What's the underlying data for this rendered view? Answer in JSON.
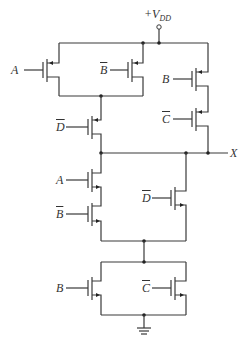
{
  "diagram": {
    "type": "CMOS logic gate schematic",
    "supply_label": "+V",
    "supply_subscript": "DD",
    "output_label": "X",
    "ground": "ground-symbol",
    "pull_up_network": [
      {
        "id": "p1",
        "type": "pMOS",
        "input": "A",
        "inverted": false,
        "group": "parallel-top"
      },
      {
        "id": "p2",
        "type": "pMOS",
        "input": "B",
        "inverted": true,
        "group": "parallel-top"
      },
      {
        "id": "p3",
        "type": "pMOS",
        "input": "D",
        "inverted": true,
        "group": "series-after-parallel"
      },
      {
        "id": "p4",
        "type": "pMOS",
        "input": "B",
        "inverted": false,
        "group": "series-right"
      },
      {
        "id": "p5",
        "type": "pMOS",
        "input": "C",
        "inverted": true,
        "group": "series-right"
      }
    ],
    "pull_down_network": [
      {
        "id": "n1",
        "type": "nMOS",
        "input": "A",
        "inverted": false,
        "group": "series-left"
      },
      {
        "id": "n2",
        "type": "nMOS",
        "input": "B",
        "inverted": true,
        "group": "series-left"
      },
      {
        "id": "n3",
        "type": "nMOS",
        "input": "D",
        "inverted": true,
        "group": "parallel-with-series-left"
      },
      {
        "id": "n4",
        "type": "nMOS",
        "input": "B",
        "inverted": false,
        "group": "parallel-bottom"
      },
      {
        "id": "n5",
        "type": "nMOS",
        "input": "C",
        "inverted": true,
        "group": "parallel-bottom"
      }
    ]
  },
  "labels": {
    "p1": "A",
    "p2": "B",
    "p3": "D",
    "p4": "B",
    "p5": "C",
    "n1": "A",
    "n2": "B",
    "n3": "D",
    "n4": "B",
    "n5": "C"
  }
}
